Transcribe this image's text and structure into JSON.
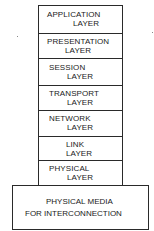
{
  "diagram": {
    "type": "layered-stack",
    "layers": [
      {
        "line1": "APPLICATION",
        "line2": "LAYER"
      },
      {
        "line1": "PRESENTATION",
        "line2": "LAYER"
      },
      {
        "line1": "SESSION",
        "line2": "LAYER"
      },
      {
        "line1": "TRANSPORT",
        "line2": "LAYER"
      },
      {
        "line1": "NETWORK",
        "line2": "LAYER"
      },
      {
        "line1": "LINK",
        "line2": "LAYER"
      },
      {
        "line1": "PHYSICAL",
        "line2": "LAYER"
      }
    ],
    "base": {
      "line1": "PHYSICAL MEDIA",
      "line2": "FOR INTERCONNECTION"
    }
  }
}
